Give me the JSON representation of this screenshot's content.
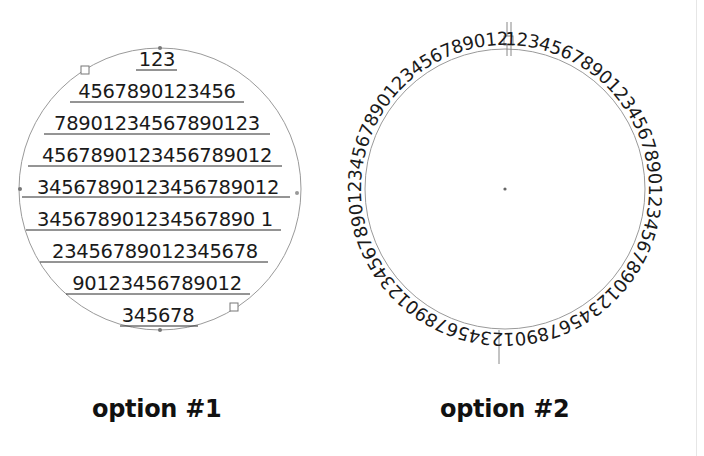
{
  "option1": {
    "caption": "option #1",
    "circle": {
      "cx": 160,
      "cy": 189,
      "r": 141,
      "stroke": "#9a9a9a"
    },
    "lines": [
      "123",
      "4567890123456",
      "78901234567890123",
      "4567890123456789012",
      "34567890123456789012",
      "345678901234567890 1",
      "23456789012345678",
      "90123456789012",
      "345678"
    ]
  },
  "option2": {
    "caption": "option #2",
    "circle": {
      "cx": 505,
      "cy": 189,
      "r": 140,
      "stroke": "#9a9a9a"
    },
    "ring_text": "1234567890123456789012345678901234567890123456789012345678901234567890123456789012345678901234"
  },
  "colors": {
    "text": "#1a1a1a",
    "path_stroke": "#9a9a9a",
    "underline": "#2a2a2a",
    "background": "#ffffff"
  }
}
